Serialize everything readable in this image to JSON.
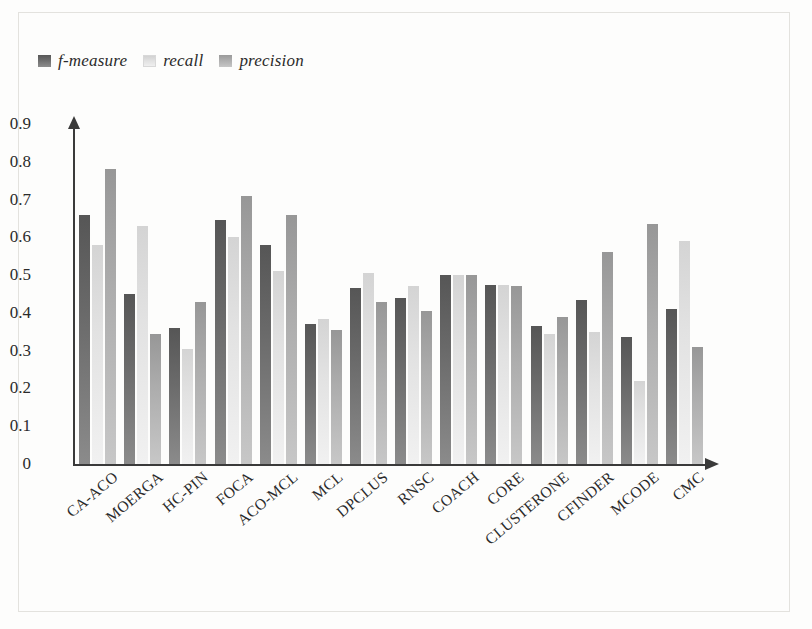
{
  "chart_data": {
    "type": "bar",
    "title": "",
    "xlabel": "",
    "ylabel": "",
    "ylim": [
      0,
      0.9
    ],
    "grid": false,
    "legend_position": "top-left",
    "ytick_labels": [
      "0.9",
      "0.8",
      "0.7",
      "0.6",
      "0.5",
      "0.4",
      "0.3",
      "0.2",
      "0.1",
      "0"
    ],
    "ytick_values": [
      0.9,
      0.8,
      0.7,
      0.6,
      0.5,
      0.4,
      0.3,
      0.2,
      0.1,
      0
    ],
    "categories": [
      "CA-ACO",
      "MOERGA",
      "HC-PIN",
      "FOCA",
      "ACO-MCL",
      "MCL",
      "DPCLUS",
      "RNSC",
      "COACH",
      "CORE",
      "CLUSTERONE",
      "CFINDER",
      "MCODE",
      "CMC"
    ],
    "series": [
      {
        "name": "f-measure",
        "color": "#6d6d6d",
        "values": [
          0.66,
          0.45,
          0.36,
          0.645,
          0.58,
          0.37,
          0.465,
          0.44,
          0.5,
          0.475,
          0.365,
          0.435,
          0.335,
          0.41
        ]
      },
      {
        "name": "recall",
        "color": "#e0e0e0",
        "values": [
          0.58,
          0.63,
          0.305,
          0.6,
          0.51,
          0.385,
          0.505,
          0.47,
          0.5,
          0.475,
          0.345,
          0.35,
          0.22,
          0.59
        ]
      },
      {
        "name": "precision",
        "color": "#aeaeae",
        "values": [
          0.78,
          0.345,
          0.43,
          0.71,
          0.66,
          0.355,
          0.43,
          0.405,
          0.5,
          0.47,
          0.39,
          0.56,
          0.635,
          0.31
        ]
      }
    ]
  }
}
